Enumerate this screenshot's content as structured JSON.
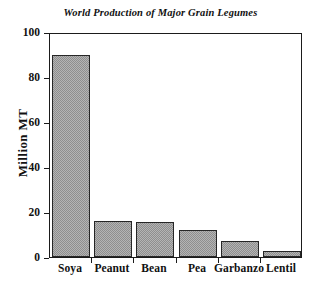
{
  "chart_data": {
    "type": "bar",
    "title": "World Production of Major Grain Legumes",
    "xlabel": "",
    "ylabel": "Million MT",
    "categories": [
      "Soya",
      "Peanut",
      "Bean",
      "Pea",
      "Garbanzo",
      "Lentil"
    ],
    "values": [
      90,
      16,
      15.5,
      12,
      7,
      2.5
    ],
    "ylim": [
      0,
      100
    ],
    "yticks": [
      0,
      20,
      40,
      60,
      80,
      100
    ],
    "ytick_labels": [
      "0",
      "20",
      "40",
      "60",
      "80",
      "100"
    ],
    "grid": false,
    "legend": null,
    "bar_fill": "#b4b4b4",
    "bar_edge": "#262626",
    "axis_color": "#1b1b1b",
    "background": "#ffffff"
  }
}
